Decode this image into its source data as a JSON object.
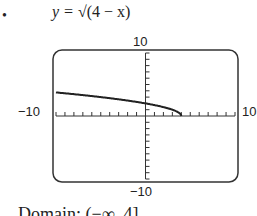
{
  "problem": {
    "bullet": "•",
    "equation_lhs": "y = ",
    "equation_rhs": "√(4 − x)",
    "domain_text": "Domain: (−∞, 4]"
  },
  "chart_data": {
    "type": "line",
    "title": "y = √(4 − x)",
    "function": "sqrt(4 - x)",
    "xlim": [
      -10,
      10
    ],
    "ylim": [
      -10,
      10
    ],
    "xscale": 1,
    "yscale": 1,
    "x": [
      -10,
      -8,
      -6,
      -4,
      -2,
      0,
      2,
      3,
      4
    ],
    "y": [
      3.74,
      3.46,
      3.16,
      2.83,
      2.45,
      2.0,
      1.41,
      1.0,
      0
    ],
    "tick_labels": {
      "ymax": "10",
      "ymin": "−10",
      "xmin": "−10",
      "xmax": "10"
    },
    "grid": false
  }
}
